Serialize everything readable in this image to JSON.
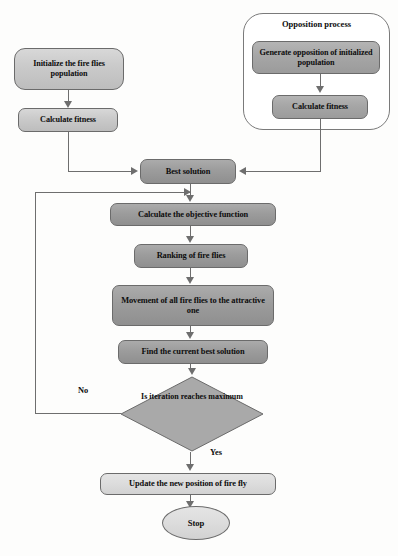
{
  "diagram": {
    "type": "flowchart",
    "colors": {
      "node_fill_light": "#cbcbcb",
      "node_fill_lighter": "#dcdcdc",
      "node_fill_mid": "#a6a6a6",
      "node_fill_dark": "#9c9c9c",
      "node_border": "#6b6b6b",
      "connector": "#6e6e6e",
      "text": "#0d0d0d",
      "background": "#fdfdfc"
    }
  },
  "group": {
    "opposition_title": "Opposition process"
  },
  "nodes": {
    "initialize": "Initialize the fire flies population",
    "calculate_fitness_left": "Calculate fitness",
    "generate_opposition": "Generate opposition of initialized population",
    "calculate_fitness_right": "Calculate fitness",
    "best_solution": "Best solution",
    "objective_function": "Calculate the objective function",
    "ranking": "Ranking of fire flies",
    "movement": "Movement of all fire flies to the attractive one",
    "find_best": "Find the current best solution",
    "decision": "Is iteration reaches maximum",
    "update_position": "Update the new position of fire fly",
    "stop": "Stop"
  },
  "edge_labels": {
    "no": "No",
    "yes": "Yes"
  }
}
